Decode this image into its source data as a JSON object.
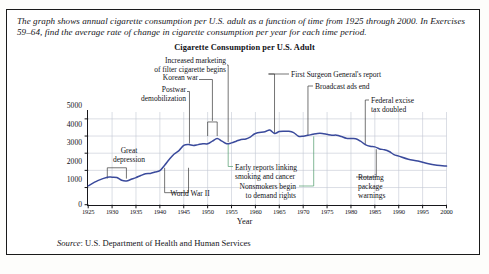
{
  "exercise": {
    "intro": "The graph shows annual cigarette consumption per U.S. adult as a function of time from 1925 through 2000. In Exercises 59–64, find the average rate of change in cigarette consumption per year for each time period.",
    "source_label": "Source",
    "source_text": ": U.S. Department of Health and Human Services"
  },
  "chart_data": {
    "type": "line",
    "title": "Cigarette Consumption per U.S. Adult",
    "xlabel": "Year",
    "ylabel": "Cigarettes per Year",
    "xlim": [
      1925,
      2000
    ],
    "ylim": [
      0,
      5400
    ],
    "grid": true,
    "legend": "none",
    "line_color": "#3a4a9c",
    "xticks": [
      1925,
      1930,
      1935,
      1940,
      1945,
      1950,
      1955,
      1960,
      1965,
      1970,
      1975,
      1980,
      1985,
      1990,
      1995,
      2000
    ],
    "yticks": [
      0,
      1000,
      2000,
      3000,
      4000,
      5000
    ],
    "x": [
      1925,
      1927,
      1929,
      1930,
      1931,
      1932,
      1933,
      1934,
      1935,
      1936,
      1937,
      1938,
      1939,
      1940,
      1941,
      1942,
      1943,
      1944,
      1945,
      1946,
      1947,
      1948,
      1949,
      1950,
      1951,
      1952,
      1953,
      1954,
      1955,
      1956,
      1957,
      1958,
      1959,
      1960,
      1962,
      1963,
      1964,
      1965,
      1966,
      1967,
      1968,
      1969,
      1970,
      1971,
      1972,
      1973,
      1974,
      1975,
      1976,
      1977,
      1978,
      1979,
      1980,
      1981,
      1982,
      1983,
      1984,
      1985,
      1986,
      1987,
      1988,
      1989,
      1990,
      1992,
      1994,
      1996,
      1998,
      2000
    ],
    "y": [
      1100,
      1400,
      1600,
      1600,
      1580,
      1420,
      1380,
      1480,
      1580,
      1700,
      1800,
      1820,
      1900,
      1980,
      2300,
      2650,
      2950,
      3150,
      3450,
      3500,
      3450,
      3500,
      3550,
      3550,
      3700,
      3850,
      3700,
      3550,
      3600,
      3700,
      3800,
      3830,
      3950,
      4150,
      4250,
      4350,
      4150,
      4260,
      4280,
      4280,
      4200,
      3990,
      3990,
      4040,
      4100,
      4150,
      4150,
      4100,
      4050,
      4050,
      3970,
      3870,
      3850,
      3840,
      3700,
      3500,
      3400,
      3370,
      3250,
      3200,
      3100,
      2920,
      2830,
      2650,
      2550,
      2400,
      2300,
      2250
    ],
    "annotations": [
      {
        "id": "great-depression",
        "label": "Great\ndepression",
        "span": [
          1929,
          1933
        ],
        "kind": "bracket-down"
      },
      {
        "id": "world-war-ii",
        "label": "World War II",
        "span": [
          1941,
          1946
        ],
        "kind": "bracket-down"
      },
      {
        "id": "postwar-demobilization",
        "label": "Postwar\ndemobilization",
        "year": 1946,
        "kind": "leader"
      },
      {
        "id": "korean-war",
        "label": "Korean war",
        "span": [
          1950,
          1952
        ],
        "kind": "bracket-up"
      },
      {
        "id": "increased-marketing-filter",
        "label": "Increased marketing\nof filter cigarette begins",
        "year": 1954,
        "kind": "leader"
      },
      {
        "id": "first-surgeon-general-report",
        "label": "First Surgeon General's report",
        "year": 1964,
        "kind": "leader"
      },
      {
        "id": "broadcast-ads-end",
        "label": "Broadcast ads end",
        "year": 1971,
        "kind": "leader"
      },
      {
        "id": "federal-excise-tax-doubled",
        "label": "Federal excise\ntax doubled",
        "year": 1983,
        "kind": "leader"
      },
      {
        "id": "early-reports-smoking-cancer",
        "label": "Early reports linking\nsmoking and cancer",
        "year": 1954,
        "kind": "leader"
      },
      {
        "id": "nonsmokers-demand-rights",
        "label": "Nonsmokers begin\nto demand rights",
        "year": 1972,
        "kind": "leader"
      },
      {
        "id": "rotating-package-warnings",
        "label": "Rotating\npackage\nwarnings",
        "year": 1985,
        "kind": "leader"
      }
    ]
  },
  "annotation_text": {
    "great_depression_l1": "Great",
    "great_depression_l2": "depression",
    "world_war_ii": "World War II",
    "postwar_l1": "Postwar",
    "postwar_l2": "demobilization",
    "korean_war": "Korean war",
    "filter_l1": "Increased marketing",
    "filter_l2": "of filter cigarette begins",
    "surgeon_general": "First Surgeon General's report",
    "broadcast_ads": "Broadcast ads end",
    "excise_l1": "Federal excise",
    "excise_l2": "tax doubled",
    "early_reports_l1": "Early reports linking",
    "early_reports_l2": "smoking and cancer",
    "nonsmokers_l1": "Nonsmokers begin",
    "nonsmokers_l2": "to demand rights",
    "rotating_l1": "Rotating",
    "rotating_l2": "package",
    "rotating_l3": "warnings"
  }
}
